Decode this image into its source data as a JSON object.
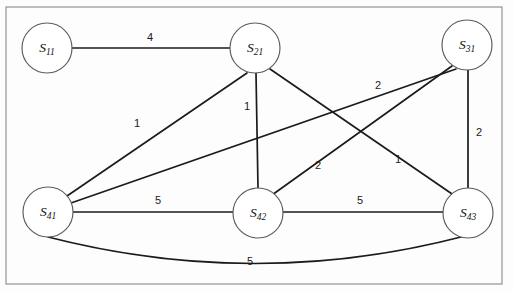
{
  "figure": {
    "type": "weighted-undirected-graph",
    "frame": {
      "x": 6,
      "y": 7,
      "width": 496,
      "height": 277,
      "stroke": "#8a8a8a"
    },
    "canvas": {
      "width": 514,
      "height": 292,
      "background": "#ffffff"
    },
    "node_radius": 25,
    "edge_color": "#1b1b1b",
    "node_fill": "#ffffff",
    "node_stroke": "#5c5c5c"
  },
  "nodes": [
    {
      "id": "s11",
      "label": "S",
      "subscript": "11",
      "x": 47,
      "y": 48
    },
    {
      "id": "s21",
      "label": "S",
      "subscript": "21",
      "x": 255,
      "y": 48
    },
    {
      "id": "s31",
      "label": "S",
      "subscript": "31",
      "x": 467,
      "y": 45
    },
    {
      "id": "s41",
      "label": "S",
      "subscript": "41",
      "x": 48,
      "y": 212
    },
    {
      "id": "s42",
      "label": "S",
      "subscript": "42",
      "x": 258,
      "y": 213
    },
    {
      "id": "s43",
      "label": "S",
      "subscript": "43",
      "x": 468,
      "y": 213
    }
  ],
  "edges": [
    {
      "id": "e-s11-s21",
      "from": "s11",
      "to": "s21",
      "weight": "4",
      "x1": 72,
      "y1": 48,
      "x2": 230,
      "y2": 48,
      "label_x": 150,
      "label_y": 38,
      "shape": "line"
    },
    {
      "id": "e-s41-s21",
      "from": "s41",
      "to": "s21",
      "weight": "1",
      "x1": 67,
      "y1": 196,
      "x2": 247,
      "y2": 73,
      "label_x": 137,
      "label_y": 124,
      "shape": "line"
    },
    {
      "id": "e-s41-s31",
      "from": "s41",
      "to": "s31",
      "weight": "2",
      "x1": 71,
      "y1": 203,
      "x2": 456,
      "y2": 69,
      "label_x": 378,
      "label_y": 86,
      "shape": "line"
    },
    {
      "id": "e-s21-s42",
      "from": "s21",
      "to": "s42",
      "weight": "1",
      "x1": 256,
      "y1": 73,
      "x2": 258,
      "y2": 188,
      "label_x": 247,
      "label_y": 107,
      "shape": "line"
    },
    {
      "id": "e-s31-s43",
      "from": "s31",
      "to": "s43",
      "weight": "2",
      "x1": 468,
      "y1": 70,
      "x2": 468,
      "y2": 188,
      "label_x": 479,
      "label_y": 133,
      "shape": "line"
    },
    {
      "id": "e-s21-s43",
      "from": "s21",
      "to": "s43",
      "weight": "2",
      "x1": 270,
      "y1": 69,
      "x2": 455,
      "y2": 196,
      "label_x": 318,
      "label_y": 166,
      "shape": "line"
    },
    {
      "id": "e-s31-s42",
      "from": "s31",
      "to": "s42",
      "weight": "1",
      "x1": 452,
      "y1": 66,
      "x2": 272,
      "y2": 195,
      "label_x": 398,
      "label_y": 160,
      "shape": "line"
    },
    {
      "id": "e-s41-s42",
      "from": "s41",
      "to": "s42",
      "weight": "5",
      "x1": 73,
      "y1": 212,
      "x2": 233,
      "y2": 212,
      "label_x": 158,
      "label_y": 201,
      "shape": "line"
    },
    {
      "id": "e-s42-s43",
      "from": "s42",
      "to": "s43",
      "weight": "5",
      "x1": 283,
      "y1": 212,
      "x2": 443,
      "y2": 212,
      "label_x": 360,
      "label_y": 201,
      "shape": "line"
    },
    {
      "id": "e-s41-s43",
      "from": "s41",
      "to": "s43",
      "weight": "5",
      "x1": 48,
      "y1": 237,
      "x2": 461,
      "y2": 237,
      "curve_cx": 255,
      "curve_cy": 290,
      "label_x": 250,
      "label_y": 262,
      "shape": "curve"
    }
  ]
}
